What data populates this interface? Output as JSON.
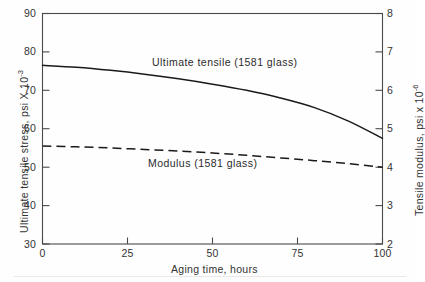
{
  "chart_data": {
    "type": "line",
    "title": "",
    "xlabel": "Aging time, hours",
    "ylabel": "Ultimate tensile stress, psi X 10",
    "ylabel_exponent": "-3",
    "y2label": "Tensile modulus, psi x 10",
    "y2label_exponent": "-6",
    "xlim": [
      0,
      100
    ],
    "ylim": [
      30,
      90
    ],
    "y2lim": [
      2,
      8
    ],
    "xticks": [
      0,
      25,
      50,
      75,
      100
    ],
    "yticks": [
      30,
      40,
      50,
      60,
      70,
      80,
      90
    ],
    "y2ticks": [
      2,
      3,
      4,
      5,
      6,
      7,
      8
    ],
    "xtick_labels": [
      "0",
      "25",
      "50",
      "75",
      "100"
    ],
    "ytick_labels": [
      "30",
      "40",
      "50",
      "60",
      "70",
      "80",
      "90"
    ],
    "y2tick_labels": [
      "2",
      "3",
      "4",
      "5",
      "6",
      "7",
      "8"
    ],
    "grid": false,
    "legend_position": "inline-annotations",
    "series": [
      {
        "name": "Ultimate tensile (1581 glass)",
        "axis": "left",
        "style": "solid",
        "color": "#1a1a1a",
        "x": [
          0,
          10,
          20,
          30,
          40,
          50,
          60,
          70,
          80,
          90,
          100
        ],
        "values": [
          76.5,
          76.0,
          75.2,
          74.2,
          73.0,
          71.6,
          70.0,
          68.0,
          65.5,
          62.0,
          57.5
        ]
      },
      {
        "name": "Modulus (1581 glass)",
        "axis": "right",
        "style": "dashed",
        "color": "#1a1a1a",
        "x": [
          0,
          10,
          20,
          30,
          40,
          50,
          60,
          70,
          80,
          90,
          100
        ],
        "values": [
          4.55,
          4.53,
          4.5,
          4.46,
          4.42,
          4.37,
          4.31,
          4.24,
          4.17,
          4.09,
          4.0
        ]
      }
    ],
    "annotations": [
      {
        "text": "Ultimate tensile (1581 glass)",
        "x_px": 152,
        "y_px": 56
      },
      {
        "text": "Modulus (1581 glass)",
        "x_px": 148,
        "y_px": 157
      }
    ]
  },
  "axes": {
    "left_title_main": "Ultimate tensile stress, psi X 10",
    "left_title_exp": "-3",
    "right_title_main": "Tensile modulus, psi x 10",
    "right_title_exp": "-6",
    "x_title": "Aging time, hours"
  },
  "ticks": {
    "left": [
      "90",
      "80",
      "70",
      "60",
      "50",
      "40",
      "30"
    ],
    "right": [
      "8",
      "7",
      "6",
      "5",
      "4",
      "3",
      "2"
    ],
    "bottom": [
      "0",
      "25",
      "50",
      "75",
      "100"
    ]
  },
  "labels": {
    "curve_solid": "Ultimate tensile (1581 glass)",
    "curve_dashed": "Modulus (1581 glass)"
  }
}
